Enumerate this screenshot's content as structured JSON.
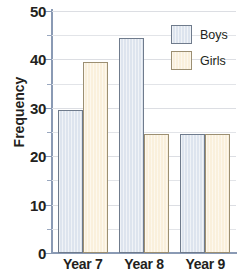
{
  "chart_data": {
    "type": "bar",
    "title": "",
    "xlabel": "",
    "ylabel": "Frequency",
    "categories": [
      "Year 7",
      "Year 8",
      "Year 9"
    ],
    "series": [
      {
        "name": "Boys",
        "values": [
          29.5,
          44.5,
          24.5
        ],
        "color": "#dde4ee",
        "border_color": "#6f7b8c"
      },
      {
        "name": "Girls",
        "values": [
          39.5,
          24.5,
          24.5
        ],
        "color": "#faf0dc",
        "border_color": "#9c8f72"
      }
    ],
    "ylim": [
      0,
      50
    ],
    "y_major_ticks": [
      0,
      10,
      20,
      30,
      40,
      50
    ],
    "y_minor_ticks": [
      5,
      15,
      25,
      35,
      45
    ],
    "y_tick_labels": [
      "0",
      "10",
      "20",
      "30",
      "40",
      "50"
    ],
    "grid": true,
    "grid_color": "#e2e4e8",
    "legend_position": "top-right",
    "axis_color": "#8a9ab4"
  },
  "legend": {
    "entries": [
      {
        "label": "Boys"
      },
      {
        "label": "Girls"
      }
    ]
  },
  "axes": {
    "y_title": "Frequency"
  }
}
